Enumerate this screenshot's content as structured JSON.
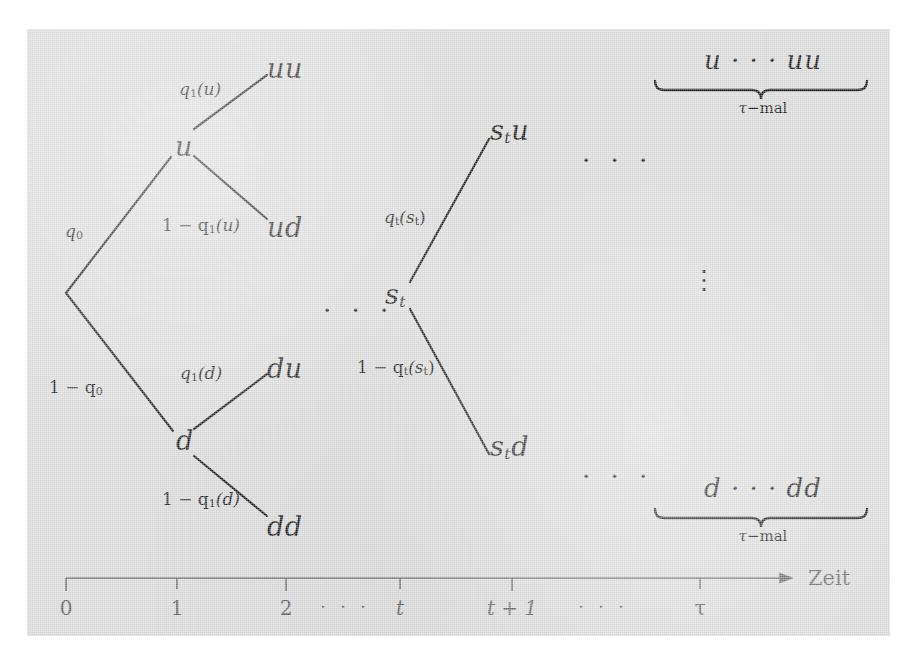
{
  "figure": {
    "background_color": "#dcdcdc",
    "ink_color": "#1a1a1a",
    "axis_color": "#6a6a6a"
  },
  "tree": {
    "nodes": {
      "root_label": "",
      "up": "u",
      "down": "d",
      "middle_state_base": "s",
      "middle_state_sub": "t"
    },
    "leaves": {
      "uu": "uu",
      "ud": "ud",
      "du": "du",
      "dd": "dd",
      "stu_base": "s",
      "stu_sub": "t",
      "stu_tail": "u",
      "std_base": "s",
      "std_sub": "t",
      "std_tail": "d"
    },
    "probabilities": {
      "q0": "q",
      "q0_sub": "0",
      "one_minus_q0_prefix": "1 − q",
      "one_minus_q0_sub": "0",
      "q1u": "q",
      "q1u_sub": "1",
      "q1u_arg": "(u)",
      "one_minus_q1u": "1 − q",
      "one_minus_q1u_sub": "1",
      "one_minus_q1u_arg": "(u)",
      "q1d": "q",
      "q1d_sub": "1",
      "q1d_arg": "(d)",
      "one_minus_q1d": "1 − q",
      "one_minus_q1d_sub": "1",
      "one_minus_q1d_arg": "(d)",
      "qt": "q",
      "qt_sub": "t",
      "qt_arg_open": "(s",
      "qt_arg_sub": "t",
      "qt_arg_close": ")",
      "one_minus_qt": "1 − q",
      "one_minus_qt_sub": "t",
      "one_minus_qt_arg_open": "(s",
      "one_minus_qt_arg_sub": "t",
      "one_minus_qt_arg_close": ")"
    },
    "ellipses": {
      "mid_left": "· · ·",
      "top_right": "· · ·",
      "bottom_right": "· · ·",
      "vertical": "⋮"
    }
  },
  "braces": {
    "top": {
      "expression": "u · · · uu",
      "caption_tau": "τ",
      "caption_rest": "−mal"
    },
    "bottom": {
      "expression": "d · · · dd",
      "caption_tau": "τ",
      "caption_rest": "−mal"
    }
  },
  "axis": {
    "name": "Zeit",
    "ticks": [
      {
        "label": "0",
        "italic": false
      },
      {
        "label": "1",
        "italic": false
      },
      {
        "label": "2",
        "italic": false
      },
      {
        "label": "t",
        "italic": true
      },
      {
        "label": "t + 1",
        "italic": true
      },
      {
        "label": "τ",
        "italic": false
      }
    ],
    "gap_dots": "· · ·"
  }
}
